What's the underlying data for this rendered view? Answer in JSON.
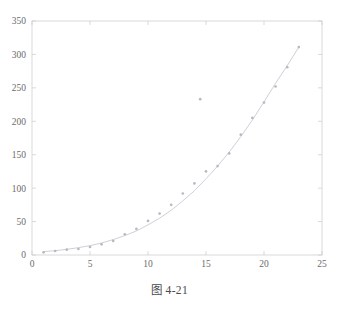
{
  "figure": {
    "caption": "图 4-21",
    "background_color": "#ffffff",
    "axis_color": "#cfcfcf",
    "tick_label_color": "#6b6b6b",
    "marker_color": "#b9b9c4",
    "fit_line_color": "#c9c9d2"
  },
  "chart_data": {
    "type": "scatter",
    "title": "",
    "subtitle": "",
    "xlabel": "",
    "ylabel": "",
    "xlim": [
      0,
      25
    ],
    "ylim": [
      0,
      350
    ],
    "xticks": [
      0,
      5,
      10,
      15,
      20,
      25
    ],
    "yticks": [
      0,
      50,
      100,
      150,
      200,
      250,
      300,
      350
    ],
    "xtick_labels": [
      "0",
      "5",
      "10",
      "15",
      "20",
      "25"
    ],
    "ytick_labels": [
      "0",
      "50",
      "100",
      "150",
      "200",
      "250",
      "300",
      "350"
    ],
    "grid": false,
    "legend": null,
    "legend_position": "none",
    "annotations": [],
    "series": [
      {
        "name": "data points",
        "kind": "scatter",
        "marker": "point",
        "color": "#b9b9c4",
        "x": [
          1,
          2,
          3,
          4,
          5,
          6,
          7,
          8,
          9,
          10,
          11,
          12,
          13,
          14,
          14.5,
          15,
          16,
          17,
          18,
          19,
          20,
          21,
          22,
          23
        ],
        "y": [
          4,
          6,
          8,
          9,
          12,
          16,
          21,
          31,
          39,
          51,
          62,
          75,
          92,
          107,
          233,
          125,
          133,
          152,
          180,
          205,
          228,
          252,
          281,
          311
        ]
      },
      {
        "name": "fitted curve",
        "kind": "line",
        "color": "#c9c9d2",
        "x": [
          1,
          2,
          3,
          4,
          5,
          6,
          7,
          8,
          9,
          10,
          11,
          12,
          13,
          14,
          15,
          16,
          17,
          18,
          19,
          20,
          21,
          22,
          23
        ],
        "y": [
          5,
          6.5,
          8.5,
          11,
          14,
          18,
          23,
          29,
          36,
          45,
          55,
          67,
          81,
          96,
          114,
          133,
          154,
          177,
          202,
          229,
          257,
          283,
          311
        ]
      }
    ],
    "outliers": [
      {
        "x": 14.5,
        "y": 233,
        "note": "point above fitted curve"
      }
    ]
  }
}
